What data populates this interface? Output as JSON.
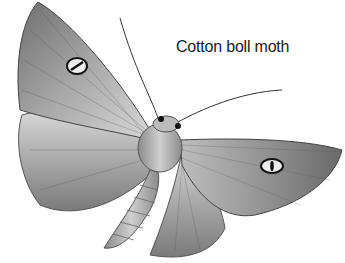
{
  "image": {
    "subject": "moth illustration",
    "style": "grayscale pencil drawing",
    "caption": "Cotton boll moth"
  },
  "colors": {
    "background": "#ffffff",
    "wing_fill": "#9a9a9a",
    "wing_light": "#cfcfcf",
    "outline": "#2a2a2a",
    "text": "#1a1a1a"
  }
}
